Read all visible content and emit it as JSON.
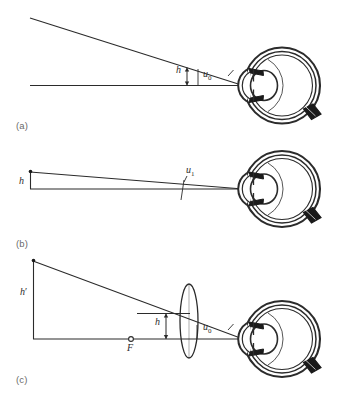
{
  "figure": {
    "background_color": "#ffffff",
    "ink_color": "#2b2b2b",
    "width": 351,
    "height": 400
  },
  "panels": [
    {
      "id": "a",
      "label": "(a)",
      "caption_text": "Distant object viewed by unaided eye",
      "labels": [
        {
          "name": "object-height-h",
          "text": "h",
          "prime": false,
          "sub": ""
        },
        {
          "name": "angle-u0",
          "text": "u",
          "prime": false,
          "sub": "0"
        }
      ]
    },
    {
      "id": "b",
      "label": "(b)",
      "caption_text": "Object at near point viewed by unaided eye",
      "labels": [
        {
          "name": "object-height-h",
          "text": "h",
          "prime": false,
          "sub": ""
        },
        {
          "name": "angle-u1",
          "text": "u",
          "prime": false,
          "sub": "1"
        }
      ]
    },
    {
      "id": "c",
      "label": "(c)",
      "caption_text": "Object at focal point of magnifier forming enlarged virtual image",
      "labels": [
        {
          "name": "image-height-h-prime",
          "text": "h",
          "prime": true,
          "sub": ""
        },
        {
          "name": "object-height-h",
          "text": "h",
          "prime": false,
          "sub": ""
        },
        {
          "name": "angle-u0",
          "text": "u",
          "prime": false,
          "sub": "0"
        },
        {
          "name": "focal-point-F",
          "text": "F",
          "prime": false,
          "sub": ""
        }
      ]
    }
  ],
  "elements": {
    "eye_name": "schematic-eye-cross-section",
    "lens_name": "magnifier-lens",
    "axis_name": "optical-axis",
    "ray_name": "chief-ray",
    "focal_marker_name": "focal-point-marker"
  }
}
